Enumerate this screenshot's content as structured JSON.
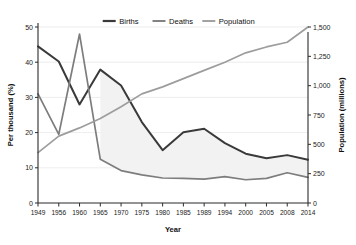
{
  "chart_data": {
    "type": "line",
    "title": "",
    "xlabel": "Year",
    "ylabel": "Per thousand (%)",
    "ylabel_right": "Population (millions)",
    "grid": true,
    "legend_position": "top-center",
    "categories": [
      "1949",
      "1956",
      "1960",
      "1965",
      "1970",
      "1975",
      "1980",
      "1985",
      "1989",
      "1994",
      "2000",
      "2005",
      "2008",
      "2014"
    ],
    "x": [
      1949,
      1956,
      1960,
      1965,
      1970,
      1975,
      1980,
      1985,
      1989,
      1994,
      2000,
      2005,
      2008,
      2014
    ],
    "ylim": [
      0,
      50
    ],
    "yticks": [
      "0",
      "10",
      "20",
      "30",
      "40",
      "50"
    ],
    "ytick_values": [
      0,
      10,
      20,
      30,
      40,
      50
    ],
    "ylim_right": [
      0,
      1500
    ],
    "yticks_right": [
      "0",
      "250",
      "500",
      "750",
      "1,000",
      "1,250",
      "1,500"
    ],
    "ytick_values_right": [
      0,
      250,
      500,
      750,
      1000,
      1250,
      1500
    ],
    "series": [
      {
        "name": "Births",
        "axis": "left",
        "color": "#3a3a3a",
        "width": 2.0,
        "values": [
          44.5,
          40.2,
          28.0,
          37.9,
          33.4,
          23.0,
          15.0,
          20.1,
          21.1,
          17.0,
          14.0,
          12.7,
          13.6,
          12.3
        ]
      },
      {
        "name": "Deaths",
        "axis": "left",
        "color": "#7d7d7d",
        "width": 1.7,
        "values": [
          31.0,
          19.5,
          48.0,
          12.4,
          9.2,
          8.0,
          7.1,
          7.0,
          6.8,
          7.5,
          6.6,
          7.0,
          8.6,
          7.3
        ]
      },
      {
        "name": "Population",
        "axis": "right",
        "color": "#9d9d9d",
        "width": 1.7,
        "values": [
          430,
          570,
          640,
          720,
          820,
          930,
          990,
          1060,
          1130,
          1200,
          1280,
          1330,
          1370,
          1500
        ]
      }
    ],
    "area_fill": {
      "between": [
        "Births",
        "Deaths"
      ],
      "color": "#f2f2f2",
      "start_index": 3
    }
  },
  "legend": {
    "items": [
      {
        "label": "Births",
        "color": "#3a3a3a"
      },
      {
        "label": "Deaths",
        "color": "#7d7d7d"
      },
      {
        "label": "Population",
        "color": "#9d9d9d"
      }
    ]
  }
}
